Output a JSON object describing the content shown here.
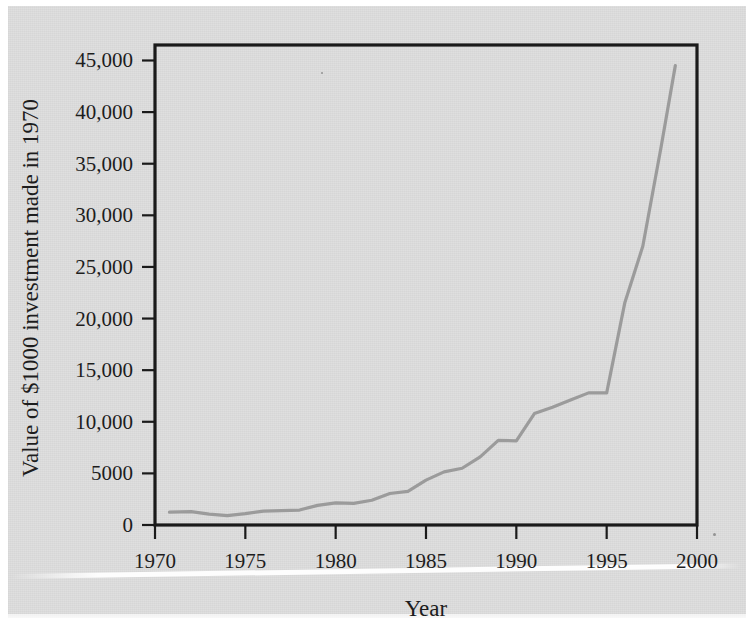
{
  "figure": {
    "background_color": "#dedede",
    "plot_background_color": "#dedede",
    "frame_color": "#1a1a1a",
    "text_color": "#1d1d1d"
  },
  "chart_data": {
    "type": "line",
    "title": "",
    "subtitle": "",
    "xlabel": "Year",
    "ylabel": "Value of $1000 investment made in 1970",
    "xlim": [
      1970,
      2000
    ],
    "ylim": [
      0,
      46500
    ],
    "grid": false,
    "legend": false,
    "legend_position": "none",
    "line_color": "#9b9b9b",
    "line_width": 3.2,
    "x_tick_labels": [
      "1970",
      "1975",
      "1980",
      "1985",
      "1990",
      "1995",
      "2000"
    ],
    "x_ticks": [
      1970,
      1975,
      1980,
      1985,
      1990,
      1995,
      2000
    ],
    "y_tick_labels": [
      "0",
      "5000",
      "10,000",
      "15,000",
      "20,000",
      "25,000",
      "30,000",
      "35,000",
      "40,000",
      "45,000"
    ],
    "y_ticks": [
      0,
      5000,
      10000,
      15000,
      20000,
      25000,
      30000,
      35000,
      40000,
      45000
    ],
    "series": [
      {
        "name": "Value of $1000 investment made in 1970",
        "x": [
          1970.8,
          1972,
          1973,
          1974,
          1975,
          1976,
          1977,
          1978,
          1979,
          1980,
          1981,
          1982,
          1983,
          1984,
          1985,
          1986,
          1987,
          1988,
          1989,
          1990,
          1991,
          1992,
          1993,
          1994,
          1995,
          1996,
          1997,
          1998,
          1998.8
        ],
        "values": [
          1250,
          1300,
          1050,
          900,
          1100,
          1350,
          1400,
          1450,
          1900,
          2150,
          2100,
          2400,
          3050,
          3250,
          4350,
          5150,
          5500,
          6600,
          8200,
          8150,
          10800,
          11400,
          12100,
          12800,
          12800,
          21500,
          27000,
          36500,
          44500
        ]
      }
    ]
  }
}
